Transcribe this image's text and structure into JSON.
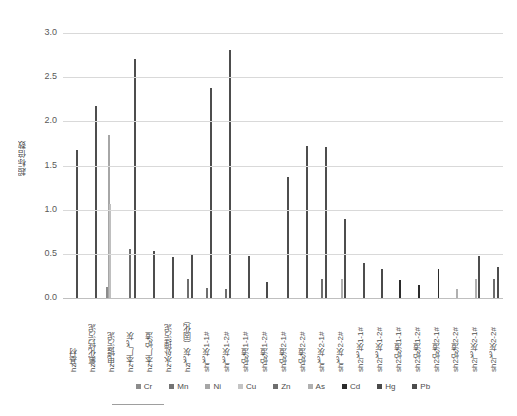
{
  "chart_data": {
    "type": "bar",
    "title": "",
    "xlabel": "",
    "ylabel": "超标倍数",
    "ylim": [
      0.0,
      3.0
    ],
    "ytick_labels": [
      "3.0",
      "2.5",
      "2.0",
      "1.5",
      "1.0",
      "0.5",
      "0.0"
    ],
    "ytick_values": [
      3.0,
      2.5,
      2.0,
      1.5,
      1.0,
      0.5,
      0.0
    ],
    "grid": true,
    "legend_position": "bottom",
    "categories": [
      "hz基材",
      "hz氟化钙污泥",
      "hz电镀污泥",
      "hz本厂飞灰",
      "hz本厂炉渣",
      "hz水处理污泥",
      "hz飞灰（固化）",
      "sh飞灰1-1#",
      "sh飞灰1-2#",
      "sh炉渣1-1#",
      "sh炉渣1-2#",
      "sh炉渣2-1#",
      "sh炉渣2-2#",
      "sh飞灰2-1#",
      "sh飞灰2-2#",
      "sh2飞灰1-1#",
      "sh2飞灰1-2#",
      "sh2炉渣1-1#",
      "sh2炉渣1-2#",
      "sh2炉渣2-1#",
      "sh2炉渣2-2#",
      "sh2飞灰2-1#",
      "sh2飞灰2-2#"
    ],
    "series": [
      {
        "name": "Cr",
        "color": "#8c8c8c",
        "values": [
          0.0,
          0.0,
          0.13,
          0.0,
          0.0,
          0.0,
          0.0,
          0.0,
          0.0,
          0.0,
          0.0,
          0.0,
          0.0,
          0.0,
          0.0,
          0.0,
          0.0,
          0.0,
          0.0,
          0.0,
          0.0,
          0.0,
          0.0
        ]
      },
      {
        "name": "Mn",
        "color": "#737373",
        "values": [
          0.0,
          0.0,
          0.0,
          0.0,
          0.0,
          0.0,
          0.0,
          0.0,
          0.0,
          0.0,
          0.0,
          0.0,
          0.0,
          0.0,
          0.0,
          0.0,
          0.0,
          0.0,
          0.0,
          0.0,
          0.0,
          0.0,
          0.0
        ]
      },
      {
        "name": "Ni",
        "color": "#a6a6a6",
        "values": [
          0.0,
          0.0,
          1.84,
          0.0,
          0.0,
          0.0,
          0.0,
          0.0,
          0.0,
          0.0,
          0.0,
          0.0,
          0.0,
          0.0,
          0.0,
          0.0,
          0.0,
          0.0,
          0.0,
          0.0,
          0.0,
          0.0,
          0.0
        ]
      },
      {
        "name": "Cu",
        "color": "#bfbfbf",
        "values": [
          0.0,
          0.0,
          1.06,
          0.0,
          0.0,
          0.0,
          0.0,
          0.0,
          0.0,
          0.0,
          0.0,
          0.0,
          0.0,
          0.0,
          0.0,
          0.0,
          0.0,
          0.0,
          0.0,
          0.0,
          0.0,
          0.0,
          0.0
        ]
      },
      {
        "name": "Zn",
        "color": "#6e6e6e",
        "values": [
          0.0,
          0.0,
          0.0,
          0.55,
          0.0,
          0.0,
          0.21,
          0.11,
          0.1,
          0.0,
          0.0,
          0.0,
          0.0,
          0.22,
          0.0,
          0.0,
          0.0,
          0.0,
          0.0,
          0.0,
          0.0,
          0.0,
          0.21
        ]
      },
      {
        "name": "As",
        "color": "#b0b0b0",
        "values": [
          0.0,
          0.0,
          0.0,
          0.0,
          0.0,
          0.0,
          0.0,
          0.0,
          0.0,
          0.0,
          0.0,
          0.0,
          0.0,
          0.0,
          0.21,
          0.0,
          0.0,
          0.0,
          0.0,
          0.0,
          0.1,
          0.22,
          0.0
        ]
      },
      {
        "name": "Cd",
        "color": "#2b2b2b",
        "values": [
          0.0,
          0.0,
          0.0,
          0.0,
          0.0,
          0.0,
          0.0,
          0.0,
          0.0,
          0.0,
          0.0,
          0.0,
          0.0,
          0.0,
          0.0,
          0.0,
          0.0,
          0.2,
          0.15,
          0.33,
          0.0,
          0.0,
          0.0
        ]
      },
      {
        "name": "Hg",
        "color": "#4a4a4a",
        "values": [
          0.0,
          0.0,
          0.0,
          0.0,
          0.0,
          0.0,
          0.0,
          0.0,
          0.0,
          0.0,
          0.18,
          0.0,
          0.0,
          0.0,
          0.0,
          0.0,
          0.33,
          0.0,
          0.0,
          0.0,
          0.0,
          0.0,
          0.0
        ]
      },
      {
        "name": "Pb",
        "color": "#4d4d4d",
        "values": [
          1.67,
          2.17,
          0.0,
          2.71,
          0.53,
          0.46,
          0.49,
          2.38,
          2.81,
          0.48,
          0.0,
          1.37,
          1.72,
          1.71,
          0.9,
          0.4,
          0.0,
          0.0,
          0.0,
          0.0,
          0.0,
          0.47,
          0.35
        ]
      }
    ],
    "legend_entries": [
      {
        "label": "Cr",
        "color": "#8c8c8c"
      },
      {
        "label": "Mn",
        "color": "#737373"
      },
      {
        "label": "Ni",
        "color": "#a6a6a6"
      },
      {
        "label": "Cu",
        "color": "#c4c4c4"
      },
      {
        "label": "Zn",
        "color": "#6e6e6e"
      },
      {
        "label": "As",
        "color": "#b0b0b0"
      },
      {
        "label": "Cd",
        "color": "#2b2b2b"
      },
      {
        "label": "Hg",
        "color": "#4a4a4a"
      },
      {
        "label": "Pb",
        "color": "#4d4d4d"
      }
    ]
  }
}
